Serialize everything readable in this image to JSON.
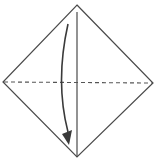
{
  "diagram": {
    "type": "origami-fold-step",
    "colors": {
      "paper_outline": "#4a4a4a",
      "crease_line": "#4a4a4a",
      "valley_fold_line": "#555555",
      "arrow": "#3a3a3a",
      "background": "#ffffff"
    },
    "elements": {
      "paper": {
        "shape": "diamond",
        "vertices": {
          "top": [
            77,
            5
          ],
          "right": [
            153,
            83
          ],
          "bottom": [
            77,
            157
          ],
          "left": [
            3,
            82
          ]
        }
      },
      "vertical_crease": {
        "style": "solid",
        "from": [
          77,
          12
        ],
        "to": [
          77,
          156
        ]
      },
      "horizontal_fold": {
        "style": "dashed",
        "label": "valley-fold",
        "from": [
          3,
          82
        ],
        "to": [
          153,
          83
        ]
      },
      "fold_arrow": {
        "direction": "down",
        "from": [
          68,
          24
        ],
        "to": [
          69,
          144
        ]
      }
    }
  }
}
